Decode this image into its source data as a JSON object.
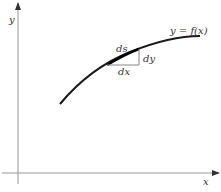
{
  "diagram": {
    "axes": {
      "x_label": "x",
      "y_label": "y"
    },
    "curve_label": "y = f(x)",
    "differentials": {
      "ds": "ds",
      "dx": "dx",
      "dy": "dy"
    },
    "colors": {
      "axis": "#888888",
      "curve": "#1a1a1a",
      "triangle": "#888888",
      "text": "#333333"
    }
  }
}
